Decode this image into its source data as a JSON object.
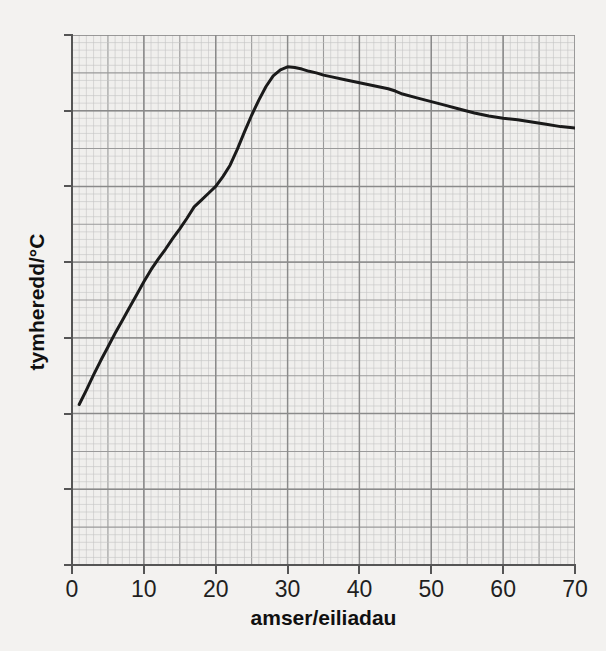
{
  "page": {
    "background_color": "#f3f2f0",
    "cropped_title_fragment": "  "
  },
  "chart_data": {
    "type": "line",
    "title": "",
    "xlabel": "amser/eiliadau",
    "ylabel": "tymheredd/°C",
    "xlim": [
      0,
      70
    ],
    "ylim": [
      0,
      70
    ],
    "xticks": [
      "0",
      "10",
      "20",
      "30",
      "40",
      "50",
      "60",
      "70"
    ],
    "yticks": [
      "0",
      "10",
      "20",
      "30",
      "40",
      "50",
      "60",
      "70"
    ],
    "xtick_values": [
      0,
      10,
      20,
      30,
      40,
      50,
      60,
      70
    ],
    "ytick_values": [
      0,
      10,
      20,
      30,
      40,
      50,
      60,
      70
    ],
    "grid": true,
    "grid_minor_step": 1,
    "grid_major_step": 5,
    "legend": null,
    "line_color": "#1a1a1a",
    "line_width": 3,
    "grid_major_color": "#9a9a9a",
    "grid_minor_color": "#c4c4c4",
    "axis_color": "#555555",
    "plot_background": "#f0efed",
    "series": [
      {
        "name": "tymheredd",
        "x": [
          1,
          2,
          3,
          4,
          5,
          6,
          7,
          8,
          9,
          10,
          11,
          12,
          13,
          14,
          15,
          16,
          17,
          18,
          19,
          20,
          21,
          22,
          23,
          24,
          25,
          26,
          27,
          28,
          29,
          30,
          31,
          32,
          33,
          34,
          35,
          36,
          38,
          40,
          42,
          44,
          45,
          46,
          48,
          50,
          52,
          54,
          56,
          58,
          60,
          62,
          64,
          66,
          68,
          70
        ],
        "y": [
          21.2,
          23.1,
          25.1,
          27.0,
          28.8,
          30.6,
          32.3,
          34.0,
          35.7,
          37.4,
          39.0,
          40.4,
          41.7,
          43.1,
          44.4,
          45.8,
          47.3,
          48.2,
          49.1,
          50.0,
          51.3,
          52.8,
          54.9,
          57.2,
          59.4,
          61.4,
          63.2,
          64.6,
          65.4,
          65.8,
          65.7,
          65.5,
          65.2,
          65.0,
          64.7,
          64.5,
          64.1,
          63.7,
          63.3,
          62.9,
          62.6,
          62.2,
          61.7,
          61.2,
          60.7,
          60.2,
          59.7,
          59.3,
          59.0,
          58.8,
          58.5,
          58.2,
          57.9,
          57.7
        ]
      }
    ],
    "annotations": {
      "start_value": 21.2,
      "peak_value": 65.8,
      "peak_time": 30,
      "end_value": 57.7,
      "end_time": 70
    }
  }
}
